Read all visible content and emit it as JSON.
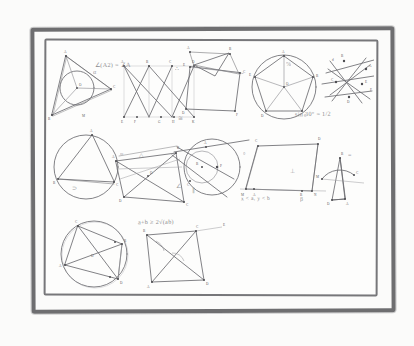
{
  "artwork": {
    "title": "Hand-drawn geometry notebook page",
    "medium": "pencil sketch on paper in a drawn double frame",
    "background_color": "#fbfbfa",
    "paper_color": "#fdfdfc",
    "ink_color": "#6c6c70",
    "frame_color": "#6e6e70"
  },
  "notes": {
    "angle_formula": "∠(A2) = ∠A",
    "sine_identity": "sin 30° = 1/2",
    "amgm_inequality": "a+b ≥ 2√(ab)",
    "inequality_pair": "x < a,  y < b"
  },
  "marks": {
    "percent": "%",
    "approx": "≈",
    "parallel": "∥",
    "perpendicular": "⊥",
    "angle": "∠",
    "triangle": "△",
    "therefore": "∴",
    "congruent": "≅",
    "similar": "∼",
    "equals": "=",
    "degree": "°",
    "alpha": "α",
    "beta": "β"
  },
  "figures": [
    {
      "id": "fig-incircle-triangle",
      "row": 1,
      "name": "triangle with inscribed circle",
      "vertices": [
        "A",
        "B",
        "C"
      ],
      "center_label": "O"
    },
    {
      "id": "fig-bipartite-graph",
      "row": 1,
      "name": "bipartite graph with crossing edges",
      "top_labels": [
        "A",
        "B",
        "C",
        "D"
      ],
      "bottom_labels": [
        "E",
        "F",
        "G",
        "H"
      ]
    },
    {
      "id": "fig-pentagon-crossings",
      "row": 1,
      "name": "quadrilateral with crossing apex lines",
      "vertices": [
        "A",
        "B",
        "C",
        "D",
        "E"
      ]
    },
    {
      "id": "fig-circumscribed-pentagon",
      "row": 1,
      "name": "regular pentagon inscribed in circle with radii",
      "vertices": [
        "A",
        "B",
        "C",
        "D",
        "E"
      ],
      "center_label": "O"
    },
    {
      "id": "fig-transversal-lines",
      "row": 1,
      "name": "configuration of crossing transversals",
      "vertices": [
        "A",
        "B",
        "C",
        "D",
        "E",
        "F"
      ]
    },
    {
      "id": "fig-inscribed-triangle",
      "row": 2,
      "name": "triangle inscribed in circle",
      "vertices": [
        "A",
        "B",
        "C"
      ]
    },
    {
      "id": "fig-quad-diagonals",
      "row": 2,
      "name": "quadrilateral with diagonals and midlines",
      "vertices": [
        "A",
        "B",
        "C",
        "D"
      ]
    },
    {
      "id": "fig-two-circles-secant",
      "row": 2,
      "name": "two circles with secant and tangent lines",
      "vertices": [
        "A",
        "B",
        "O",
        "P"
      ]
    },
    {
      "id": "fig-trapezoid",
      "row": 2,
      "name": "trapezoid with labeled base points",
      "vertices": [
        "A",
        "B",
        "C",
        "D"
      ]
    },
    {
      "id": "fig-triangle-arc",
      "row": 2,
      "name": "triangle with circular arc and exterior line",
      "vertices": [
        "A",
        "B",
        "C",
        "D"
      ]
    },
    {
      "id": "fig-cyclic-quadrilateral",
      "row": 3,
      "name": "cyclic quadrilateral with diagonals",
      "vertices": [
        "A",
        "B",
        "C",
        "D"
      ]
    },
    {
      "id": "fig-quad-angle-arcs",
      "row": 3,
      "name": "quadrilateral with marked angle arcs",
      "vertices": [
        "A",
        "B",
        "C",
        "D",
        "E"
      ]
    }
  ]
}
